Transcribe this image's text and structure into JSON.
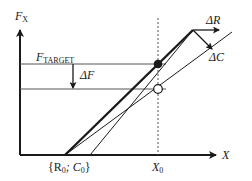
{
  "diagram": {
    "y_axis_label": "F",
    "y_axis_sub": "X",
    "x_axis_label": "X",
    "target_label": "F",
    "target_sub": "TARGET",
    "delta_f_label": "ΔF",
    "delta_r_label": "ΔR",
    "delta_c_label": "ΔC",
    "x0_label": "X",
    "x0_sub": "0",
    "origin_label": "{R",
    "origin_sub1": "0",
    "origin_mid": "; C",
    "origin_sub2": "0",
    "origin_close": "}",
    "colors": {
      "line": "#1a1a1a",
      "background": "#ffffff"
    }
  }
}
